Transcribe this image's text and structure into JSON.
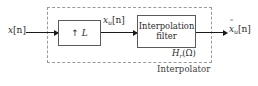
{
  "diagram": {
    "enclosure": {
      "label": "Interpolator"
    },
    "blocks": {
      "upsampler": {
        "arrow_symbol": "↑",
        "factor": "L"
      },
      "filter": {
        "line1": "Interpolation",
        "line2": "filter",
        "transfer_function": {
          "symbol": "H",
          "subscript": "r",
          "open_paren": "(",
          "argument": "Ω",
          "close_paren": ")"
        }
      }
    },
    "signals": {
      "input": {
        "symbol": "x",
        "subscript": "",
        "index": "[n]"
      },
      "intermediate": {
        "symbol": "x",
        "subscript": "u",
        "index": "[n]"
      },
      "output": {
        "accent": "˜",
        "symbol": "x",
        "subscript": "u",
        "index": "[n]"
      }
    },
    "colors": {
      "background": "#ffffff",
      "wire": "#1a1a1a",
      "block_border": "#5a5a5a",
      "dashed_border": "#9a9a9a",
      "text": "#2b2b2b"
    }
  }
}
